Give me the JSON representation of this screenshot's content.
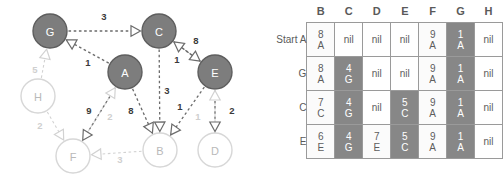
{
  "graph": {
    "nodes": [
      {
        "id": "G",
        "label": "G",
        "cx": 50,
        "cy": 31,
        "r": 17,
        "state": "visited"
      },
      {
        "id": "C",
        "label": "C",
        "cx": 159,
        "cy": 31,
        "r": 17,
        "state": "visited"
      },
      {
        "id": "A",
        "label": "A",
        "cx": 125,
        "cy": 72,
        "r": 17,
        "state": "visited"
      },
      {
        "id": "E",
        "label": "E",
        "cx": 215,
        "cy": 72,
        "r": 17,
        "state": "visited"
      },
      {
        "id": "H",
        "label": "H",
        "cx": 38,
        "cy": 96,
        "r": 17,
        "state": "unvisited"
      },
      {
        "id": "F",
        "label": "F",
        "cx": 73,
        "cy": 156,
        "r": 17,
        "state": "unvisited"
      },
      {
        "id": "B",
        "label": "B",
        "cx": 160,
        "cy": 150,
        "r": 17,
        "state": "unvisited"
      },
      {
        "id": "D",
        "label": "D",
        "cx": 215,
        "cy": 150,
        "r": 17,
        "state": "unvisited"
      }
    ],
    "edges": [
      {
        "from": "G",
        "to": "C",
        "weight": "3",
        "state": "active",
        "label_x": 104,
        "label_y": 16
      },
      {
        "from": "A",
        "to": "G",
        "weight": "1",
        "state": "active",
        "label_x": 88,
        "label_y": 62
      },
      {
        "from": "C",
        "to": "E",
        "weight": "8",
        "state": "active",
        "label_x": 196,
        "label_y": 40
      },
      {
        "from": "E",
        "to": "C",
        "weight": "1",
        "state": "active",
        "label_x": 177,
        "label_y": 59
      },
      {
        "from": "C",
        "to": "B",
        "weight": "3",
        "state": "active",
        "label_x": 167,
        "label_y": 90
      },
      {
        "from": "A",
        "to": "B",
        "weight": "8",
        "state": "active",
        "label_x": 131,
        "label_y": 110
      },
      {
        "from": "A",
        "to": "F",
        "weight": "9",
        "state": "active",
        "label_x": 89,
        "label_y": 110
      },
      {
        "from": "E",
        "to": "B",
        "weight": "1",
        "state": "active",
        "label_x": 180,
        "label_y": 106
      },
      {
        "from": "E",
        "to": "D",
        "weight": "2",
        "state": "active",
        "label_x": 232,
        "label_y": 110
      },
      {
        "from": "H",
        "to": "G",
        "weight": "5",
        "state": "faded",
        "label_x": 35,
        "label_y": 69
      },
      {
        "from": "H",
        "to": "F",
        "weight": "2",
        "state": "faded",
        "label_x": 40,
        "label_y": 125
      },
      {
        "from": "F",
        "to": "A",
        "weight": "2",
        "state": "faded",
        "label_x": 110,
        "label_y": 116
      },
      {
        "from": "B",
        "to": "F",
        "weight": "3",
        "state": "faded",
        "label_x": 120,
        "label_y": 159
      },
      {
        "from": "D",
        "to": "E",
        "weight": "1",
        "state": "faded",
        "label_x": 198,
        "label_y": 116
      }
    ],
    "colors": {
      "node_visited_fill": "#7d7d7d",
      "node_visited_stroke": "#5e5e5e",
      "node_unvisited_fill": "#ffffff",
      "node_unvisited_stroke": "#d7d7d7",
      "edge_active": "#6b6b6b",
      "edge_faded": "#d2d2d2",
      "weight_active": "#3a3a3a",
      "weight_faded": "#cfcfcf"
    }
  },
  "table": {
    "column_headers": [
      "B",
      "C",
      "D",
      "E",
      "F",
      "G",
      "H"
    ],
    "row_labels": [
      "Start A",
      "G",
      "C",
      "E"
    ],
    "nil_text": "nil",
    "rows": [
      [
        {
          "top": "8",
          "bottom": "A",
          "highlight": false
        },
        {
          "top": "nil",
          "bottom": "",
          "highlight": false
        },
        {
          "top": "nil",
          "bottom": "",
          "highlight": false
        },
        {
          "top": "nil",
          "bottom": "",
          "highlight": false
        },
        {
          "top": "9",
          "bottom": "A",
          "highlight": false
        },
        {
          "top": "1",
          "bottom": "A",
          "highlight": true
        },
        {
          "top": "nil",
          "bottom": "",
          "highlight": false
        }
      ],
      [
        {
          "top": "8",
          "bottom": "A",
          "highlight": false
        },
        {
          "top": "4",
          "bottom": "G",
          "highlight": true
        },
        {
          "top": "nil",
          "bottom": "",
          "highlight": false
        },
        {
          "top": "nil",
          "bottom": "",
          "highlight": false
        },
        {
          "top": "9",
          "bottom": "A",
          "highlight": false
        },
        {
          "top": "1",
          "bottom": "A",
          "highlight": true
        },
        {
          "top": "nil",
          "bottom": "",
          "highlight": false
        }
      ],
      [
        {
          "top": "7",
          "bottom": "C",
          "highlight": false
        },
        {
          "top": "4",
          "bottom": "G",
          "highlight": true
        },
        {
          "top": "nil",
          "bottom": "",
          "highlight": false
        },
        {
          "top": "5",
          "bottom": "C",
          "highlight": true
        },
        {
          "top": "9",
          "bottom": "A",
          "highlight": false
        },
        {
          "top": "1",
          "bottom": "A",
          "highlight": true
        },
        {
          "top": "nil",
          "bottom": "",
          "highlight": false
        }
      ],
      [
        {
          "top": "6",
          "bottom": "E",
          "highlight": false
        },
        {
          "top": "4",
          "bottom": "G",
          "highlight": true
        },
        {
          "top": "7",
          "bottom": "E",
          "highlight": false
        },
        {
          "top": "5",
          "bottom": "C",
          "highlight": true
        },
        {
          "top": "9",
          "bottom": "A",
          "highlight": false
        },
        {
          "top": "1",
          "bottom": "A",
          "highlight": true
        },
        {
          "top": "nil",
          "bottom": "",
          "highlight": false
        }
      ]
    ],
    "colors": {
      "highlight_bg": "#878787",
      "cell_bg": "#fbfbfb",
      "border": "#9a9a9a",
      "text": "#5d5d5d"
    }
  }
}
